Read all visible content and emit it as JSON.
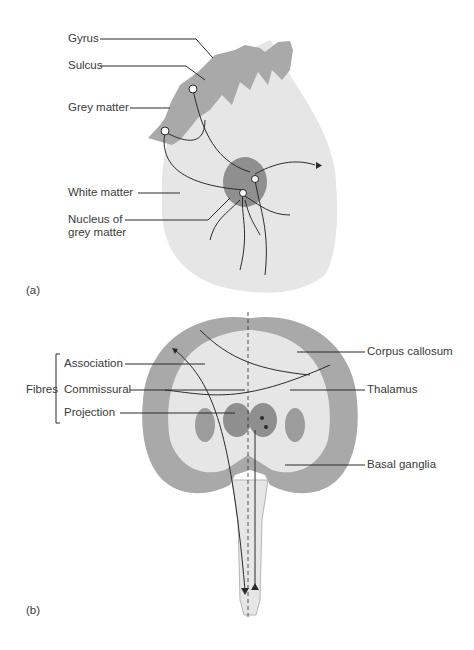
{
  "panel_a": {
    "tag": "(a)",
    "labels": {
      "gyrus": "Gyrus",
      "sulcus": "Sulcus",
      "grey_matter": "Grey matter",
      "white_matter": "White matter",
      "nucleus_line1": "Nucleus of",
      "nucleus_line2": "grey matter"
    }
  },
  "panel_b": {
    "tag": "(b)",
    "group_label": "Fibres",
    "labels": {
      "association": "Association",
      "commissural": "Commissural",
      "projection": "Projection",
      "corpus_callosum": "Corpus callosum",
      "thalamus": "Thalamus",
      "basal_ganglia": "Basal ganglia"
    }
  },
  "colors": {
    "white_matter": "#e6e6e6",
    "grey_matter": "#a9a9a9",
    "nucleus": "#8f8f8f",
    "line": "#2b2b2b",
    "text": "#3a3a3a"
  }
}
